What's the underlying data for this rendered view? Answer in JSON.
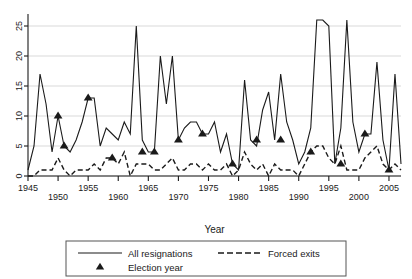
{
  "chart_data": {
    "type": "line",
    "title": "",
    "xlabel": "Year",
    "ylabel": "",
    "xlim": [
      1945,
      2007
    ],
    "ylim": [
      0,
      27
    ],
    "grid": true,
    "grid_axis": "y",
    "legend_position": "below-center",
    "y_ticks": [
      0,
      5,
      10,
      15,
      20,
      25
    ],
    "x_ticks": [
      1945,
      1950,
      1955,
      1960,
      1965,
      1970,
      1975,
      1980,
      1985,
      1990,
      1995,
      2000,
      2005
    ],
    "x": [
      1945,
      1946,
      1947,
      1948,
      1949,
      1950,
      1951,
      1952,
      1953,
      1954,
      1955,
      1956,
      1957,
      1958,
      1959,
      1960,
      1961,
      1962,
      1963,
      1964,
      1965,
      1966,
      1967,
      1968,
      1969,
      1970,
      1971,
      1972,
      1973,
      1974,
      1975,
      1976,
      1977,
      1978,
      1979,
      1980,
      1981,
      1982,
      1983,
      1984,
      1985,
      1986,
      1987,
      1988,
      1989,
      1990,
      1991,
      1992,
      1993,
      1994,
      1995,
      1996,
      1997,
      1998,
      1999,
      2000,
      2001,
      2002,
      2003,
      2004,
      2005,
      2006,
      2007
    ],
    "series": [
      {
        "name": "All resignations",
        "style": "solid",
        "color": "#1a1a1a",
        "values": [
          1,
          5,
          17,
          12,
          4,
          10,
          5,
          4,
          6,
          9,
          13,
          13,
          5,
          8,
          7,
          6,
          9,
          7,
          25,
          6,
          4,
          4,
          20,
          12,
          20,
          6,
          8,
          9,
          9,
          7,
          7,
          9,
          4,
          7,
          2,
          1,
          16,
          6,
          5,
          11,
          14,
          6,
          17,
          9,
          6,
          2,
          4,
          8,
          26,
          26,
          25,
          2,
          8,
          26,
          9,
          4,
          7,
          7,
          19,
          6,
          1,
          17,
          2
        ]
      },
      {
        "name": "Forced exits",
        "style": "dashed",
        "color": "#1a1a1a",
        "values": [
          0,
          0,
          1,
          1,
          1,
          3,
          1,
          0,
          1,
          1,
          1,
          2,
          1,
          3,
          3,
          2,
          4,
          0,
          2,
          2,
          2,
          1,
          1,
          2,
          3,
          1,
          1,
          2,
          2,
          1,
          2,
          1,
          1,
          2,
          0,
          1,
          4,
          2,
          1,
          2,
          0,
          2,
          1,
          1,
          1,
          0,
          2,
          4,
          5,
          5,
          3,
          2,
          5,
          1,
          1,
          1,
          3,
          4,
          5,
          2,
          1,
          2,
          1
        ]
      }
    ],
    "markers": {
      "name": "Election year",
      "symbol": "triangle-up",
      "color": "#1a1a1a",
      "series": "All resignations",
      "points": [
        {
          "x": 1950,
          "y": 10
        },
        {
          "x": 1951,
          "y": 5
        },
        {
          "x": 1955,
          "y": 13
        },
        {
          "x": 1959,
          "y": 3
        },
        {
          "x": 1964,
          "y": 4
        },
        {
          "x": 1966,
          "y": 4
        },
        {
          "x": 1970,
          "y": 6
        },
        {
          "x": 1974,
          "y": 7
        },
        {
          "x": 1979,
          "y": 2
        },
        {
          "x": 1983,
          "y": 6
        },
        {
          "x": 1987,
          "y": 6
        },
        {
          "x": 1992,
          "y": 4
        },
        {
          "x": 1997,
          "y": 2
        },
        {
          "x": 2001,
          "y": 7
        },
        {
          "x": 2005,
          "y": 1
        }
      ]
    },
    "legend": [
      {
        "label": "All resignations",
        "style": "solid"
      },
      {
        "label": "Forced exits",
        "style": "dashed"
      },
      {
        "label": "Election year",
        "style": "marker"
      }
    ]
  }
}
